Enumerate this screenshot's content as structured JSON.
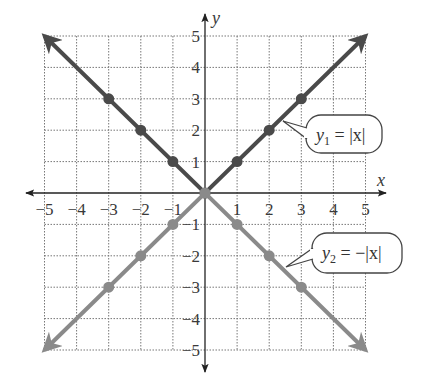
{
  "chart_data": {
    "type": "line",
    "title": "",
    "xlabel": "x",
    "ylabel": "y",
    "xlim": [
      -5,
      5
    ],
    "ylim": [
      -5,
      5
    ],
    "grid": true,
    "x_ticks": [
      -5,
      -4,
      -3,
      -2,
      -1,
      1,
      2,
      3,
      4,
      5
    ],
    "y_ticks": [
      -5,
      -4,
      -3,
      -2,
      -1,
      1,
      2,
      3,
      4,
      5
    ],
    "x_tick_labels": [
      "−5",
      "−4",
      "−3",
      "−2",
      "−1",
      "1",
      "2",
      "3",
      "4",
      "5"
    ],
    "y_tick_labels": [
      "−5",
      "−4",
      "−3",
      "−2",
      "−1",
      "1",
      "2",
      "3",
      "4",
      "5"
    ],
    "series": [
      {
        "name": "y1 = |x|",
        "label_main": "y",
        "label_sub": "1",
        "label_rest": " = |x|",
        "color": "#4a4a4a",
        "x": [
          -5,
          -3,
          -2,
          -1,
          0,
          1,
          2,
          3,
          5
        ],
        "values": [
          5,
          3,
          2,
          1,
          0,
          1,
          2,
          3,
          5
        ],
        "marked_points": [
          [
            -3,
            3
          ],
          [
            -2,
            2
          ],
          [
            -1,
            1
          ],
          [
            0,
            0
          ],
          [
            1,
            1
          ],
          [
            2,
            2
          ],
          [
            3,
            3
          ]
        ]
      },
      {
        "name": "y2 = −|x|",
        "label_main": "y",
        "label_sub": "2",
        "label_rest": " = −|x|",
        "color": "#8a8a8a",
        "x": [
          -5,
          -3,
          -2,
          -1,
          0,
          1,
          2,
          3,
          5
        ],
        "values": [
          -5,
          -3,
          -2,
          -1,
          0,
          -1,
          -2,
          -3,
          -5
        ],
        "marked_points": [
          [
            -3,
            -3
          ],
          [
            -2,
            -2
          ],
          [
            -1,
            -1
          ],
          [
            0,
            0
          ],
          [
            1,
            -1
          ],
          [
            2,
            -2
          ],
          [
            3,
            -3
          ]
        ]
      }
    ],
    "annotations": [
      {
        "text": "y1 = |x|",
        "points_to": [
          1.5,
          1.5
        ]
      },
      {
        "text": "y2 = −|x|",
        "points_to": [
          2.5,
          -2.5
        ]
      }
    ]
  },
  "labels": {
    "x_axis": "x",
    "y_axis": "y",
    "callout1": {
      "main": "y",
      "sub": "1",
      "rest": " = |x|"
    },
    "callout2": {
      "main": "y",
      "sub": "2",
      "rest": " = −|x|"
    },
    "xticks": [
      "−5",
      "−4",
      "−3",
      "−2",
      "−1",
      "1",
      "2",
      "3",
      "4",
      "5"
    ],
    "yticks_pos": [
      "1",
      "2",
      "3",
      "4",
      "5"
    ],
    "yticks_neg": [
      "−1",
      "−2",
      "−3",
      "−4",
      "−5"
    ]
  }
}
